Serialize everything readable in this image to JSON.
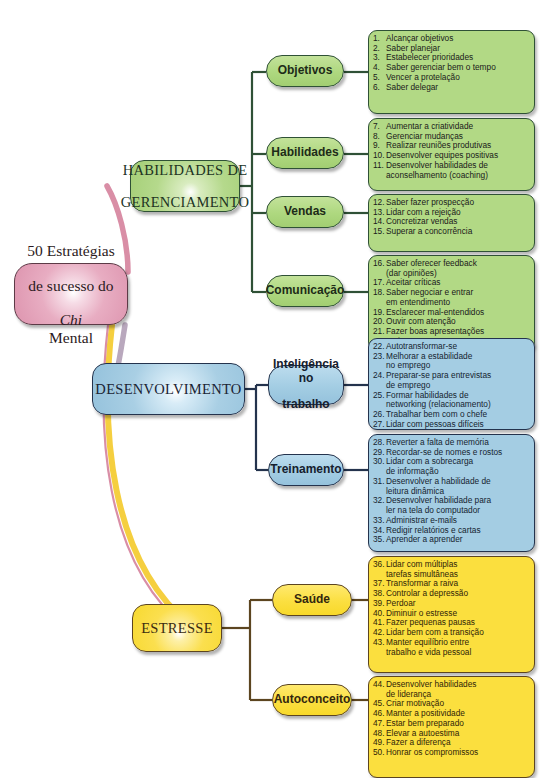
{
  "central": {
    "line1": "50 Estratégias",
    "line2": "de sucesso do",
    "line3_italic": "Chi",
    "line3_rest": " Mental"
  },
  "colors": {
    "central_fill": "#dd94ae",
    "central_stroke": "#5c3a46",
    "green_fill": "#a4cf76",
    "green_stroke": "#2f5136",
    "blue_fill": "#95c2dc",
    "blue_stroke": "#24334d",
    "yellow_fill": "#f7d92f",
    "yellow_stroke": "#5c4520",
    "link_pink": "#d98ea6",
    "link_blue": "#a9bfd4",
    "link_yellow": "#f5cf3f"
  },
  "branches": [
    {
      "id": "gerenciamento",
      "color": "green",
      "label": "HABILIDADES DE\nGERENCIAMENTO",
      "label_line1": "HABILIDADES DE",
      "label_line2": "GERENCIAMENTO",
      "subs": [
        {
          "id": "objetivos",
          "label": "Objetivos",
          "items": [
            "Alcançar objetivos",
            "Saber planejar",
            "Estabelecer prioridades",
            "Saber gerenciar bem o tempo",
            "Vencer a protelação",
            "Saber delegar"
          ],
          "start": 1
        },
        {
          "id": "habilidades",
          "label": "Habilidades",
          "items": [
            "Aumentar a criatividade",
            "Gerenciar mudanças",
            "Realizar reuniões produtivas",
            "Desenvolver equipes positivas",
            "Desenvolver habilidades de\naconselhamento (coaching)"
          ],
          "start": 7
        },
        {
          "id": "vendas",
          "label": "Vendas",
          "items": [
            "Saber fazer prospecção",
            "Lidar com a rejeição",
            "Concretizar vendas",
            "Superar a concorrência"
          ],
          "start": 12
        },
        {
          "id": "comunicacao",
          "label": "Comunicação",
          "items": [
            "Saber oferecer feedback\n(dar opiniões)",
            "Aceitar críticas",
            "Saber negociar e entrar\nem entendimento",
            "Esclarecer mal-entendidos",
            "Ouvir com atenção",
            "Fazer boas apresentações\norais"
          ],
          "start": 16
        }
      ]
    },
    {
      "id": "desenvolvimento",
      "color": "blue",
      "label": "DESENVOLVIMENTO",
      "label_line1": "DESENVOLVIMENTO",
      "label_line2": "",
      "subs": [
        {
          "id": "inteligencia-no-trabalho",
          "label": "Inteligência no\ntrabalho",
          "label_line1": "Inteligência no",
          "label_line2": "trabalho",
          "items": [
            "Autotransformar-se",
            "Melhorar a estabilidade\nno emprego",
            "Preparar-se para entrevistas\nde emprego",
            "Formar habilidades de\nnetworking (relacionamento)",
            "Trabalhar  bem com o chefe",
            "Lidar com pessoas difíceis"
          ],
          "start": 22
        },
        {
          "id": "treinamento",
          "label": "Treinamento",
          "items": [
            "Reverter a falta de memória",
            "Recordar-se de nomes e rostos",
            "Lidar com a sobrecarga\nde informação",
            "Desenvolver a habilidade de\nleitura dinâmica",
            "Desenvolver habilidade para\nler na tela do computador",
            "Administrar e-mails",
            "Redigir relatórios e cartas",
            "Aprender a aprender"
          ],
          "start": 28
        }
      ]
    },
    {
      "id": "estresse",
      "color": "yellow",
      "label": "ESTRESSE",
      "label_line1": "ESTRESSE",
      "label_line2": "",
      "subs": [
        {
          "id": "saude",
          "label": "Saúde",
          "items": [
            "Lidar com múltiplas\ntarefas simultâneas",
            "Transformar a raiva",
            "Controlar a depressão",
            "Perdoar",
            "Diminuir o estresse",
            "Fazer pequenas pausas",
            "Lidar bem com a transição",
            "Manter equilíbrio entre\ntrabalho e vida pessoal"
          ],
          "start": 36
        },
        {
          "id": "autoconceito",
          "label": "Autoconceito",
          "items": [
            "Desenvolver habilidades\nde liderança",
            "Criar motivação",
            "Manter a positividade",
            "Estar bem preparado",
            "Elevar a autoestima",
            "Fazer a diferença",
            "Honrar os compromissos"
          ],
          "start": 44
        }
      ]
    }
  ]
}
